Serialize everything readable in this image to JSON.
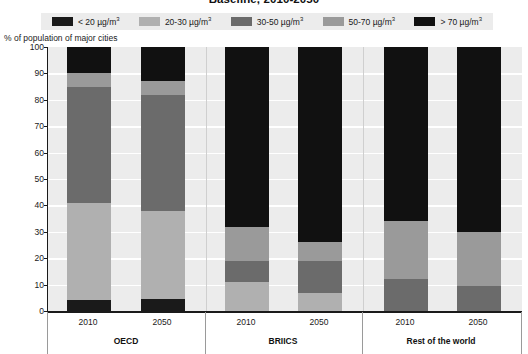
{
  "chart_data": {
    "type": "bar",
    "subtype": "stacked-100-percent",
    "title": "Baseline, 2010-2050",
    "ylabel": "% of population of major cities",
    "xlabel": "",
    "ylim": [
      0,
      100
    ],
    "yticks": [
      0,
      10,
      20,
      30,
      40,
      50,
      60,
      70,
      80,
      90,
      100
    ],
    "grid": true,
    "legend_position": "top",
    "categories": [
      "2010",
      "2050",
      "2010",
      "2050",
      "2010",
      "2050"
    ],
    "groups": [
      {
        "label": "OECD",
        "categories": [
          "2010",
          "2050"
        ]
      },
      {
        "label": "BRIICS",
        "categories": [
          "2010",
          "2050"
        ]
      },
      {
        "label": "Rest of the world",
        "categories": [
          "2010",
          "2050"
        ]
      }
    ],
    "series": [
      {
        "name": "< 20 µg/m³",
        "color": "#1a1a1a",
        "values": [
          4,
          4.5,
          0,
          0,
          0,
          0
        ]
      },
      {
        "name": "20-30 µg/m³",
        "color": "#b0b0b0",
        "values": [
          37,
          33.5,
          11,
          7,
          0,
          0
        ]
      },
      {
        "name": "30-50 µg/m³",
        "color": "#6b6b6b",
        "values": [
          44,
          44,
          8,
          12,
          12,
          9.5
        ]
      },
      {
        "name": "50-70 µg/m³",
        "color": "#9a9a9a",
        "values": [
          5,
          5,
          13,
          7,
          22,
          20.5
        ]
      },
      {
        "name": "> 70 µg/m³",
        "color": "#111111",
        "values": [
          10,
          13,
          68,
          74,
          66,
          70
        ]
      }
    ]
  },
  "legend": {
    "items": [
      {
        "label": "< 20 µg/m",
        "sup": "3",
        "color": "#1a1a1a",
        "icon": "legend-swatch-icon"
      },
      {
        "label": "20-30 µg/m",
        "sup": "3",
        "color": "#b0b0b0",
        "icon": "legend-swatch-icon"
      },
      {
        "label": "30-50 µg/m",
        "sup": "3",
        "color": "#6b6b6b",
        "icon": "legend-swatch-icon"
      },
      {
        "label": "50-70 µg/m",
        "sup": "3",
        "color": "#9a9a9a",
        "icon": "legend-swatch-icon"
      },
      {
        "label": "> 70 µg/m",
        "sup": "3",
        "color": "#111111",
        "icon": "legend-swatch-icon"
      }
    ]
  },
  "colors": {
    "plot_background": "#ececec",
    "page_background": "#ffffff",
    "gridline": "#ffffff",
    "axis": "#1a1a1a",
    "text": "#1a1a1a"
  }
}
